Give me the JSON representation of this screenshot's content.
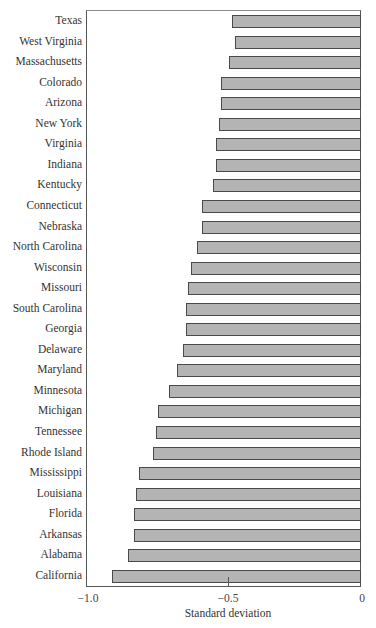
{
  "chart_data": {
    "type": "bar",
    "orientation": "horizontal",
    "title": "",
    "xlabel": "Standard deviation",
    "ylabel": "",
    "xlim": [
      -1.0,
      0
    ],
    "xticks": [
      -1.0,
      -0.5,
      0
    ],
    "xtick_labels": [
      "−1.0",
      "−0.5",
      "0"
    ],
    "grid": false,
    "legend": null,
    "categories": [
      "Texas",
      "West Virginia",
      "Massachusetts",
      "Colorado",
      "Arizona",
      "New York",
      "Virginia",
      "Indiana",
      "Kentucky",
      "Connecticut",
      "Nebraska",
      "North Carolina",
      "Wisconsin",
      "Missouri",
      "South Carolina",
      "Georgia",
      "Delaware",
      "Maryland",
      "Minnesota",
      "Michigan",
      "Tennessee",
      "Rhode Island",
      "Mississippi",
      "Louisiana",
      "Florida",
      "Arkansas",
      "Alabama",
      "California"
    ],
    "values": [
      -0.47,
      -0.46,
      -0.48,
      -0.51,
      -0.51,
      -0.52,
      -0.53,
      -0.53,
      -0.54,
      -0.58,
      -0.58,
      -0.6,
      -0.62,
      -0.63,
      -0.64,
      -0.64,
      -0.65,
      -0.67,
      -0.7,
      -0.74,
      -0.75,
      -0.76,
      -0.81,
      -0.82,
      -0.83,
      -0.83,
      -0.85,
      -0.91
    ],
    "colors": {
      "bar_fill": "#b4b4b4",
      "bar_edge": "#4a4a4a"
    }
  },
  "labels": {
    "xlabel": "Standard deviation",
    "ticks": [
      "−1.0",
      "−0.5",
      "0"
    ]
  }
}
